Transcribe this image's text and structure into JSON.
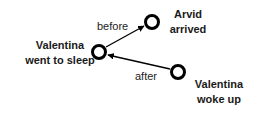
{
  "diagram": {
    "nodes": [
      {
        "id": "sleep",
        "label_lines": [
          "Valentina",
          "went to sleep"
        ],
        "cx": 99,
        "cy": 52
      },
      {
        "id": "arvid",
        "label_lines": [
          "Arvid",
          "arrived"
        ],
        "cx": 152,
        "cy": 22
      },
      {
        "id": "woke",
        "label_lines": [
          "Valentina",
          "woke up"
        ],
        "cx": 178,
        "cy": 72
      }
    ],
    "edges": [
      {
        "from": "sleep",
        "to": "arvid",
        "label": "before"
      },
      {
        "from": "woke",
        "to": "sleep",
        "label": "after"
      }
    ],
    "colors": {
      "stroke": "#000000",
      "text": "#1a1a1a",
      "background": "#ffffff"
    }
  }
}
